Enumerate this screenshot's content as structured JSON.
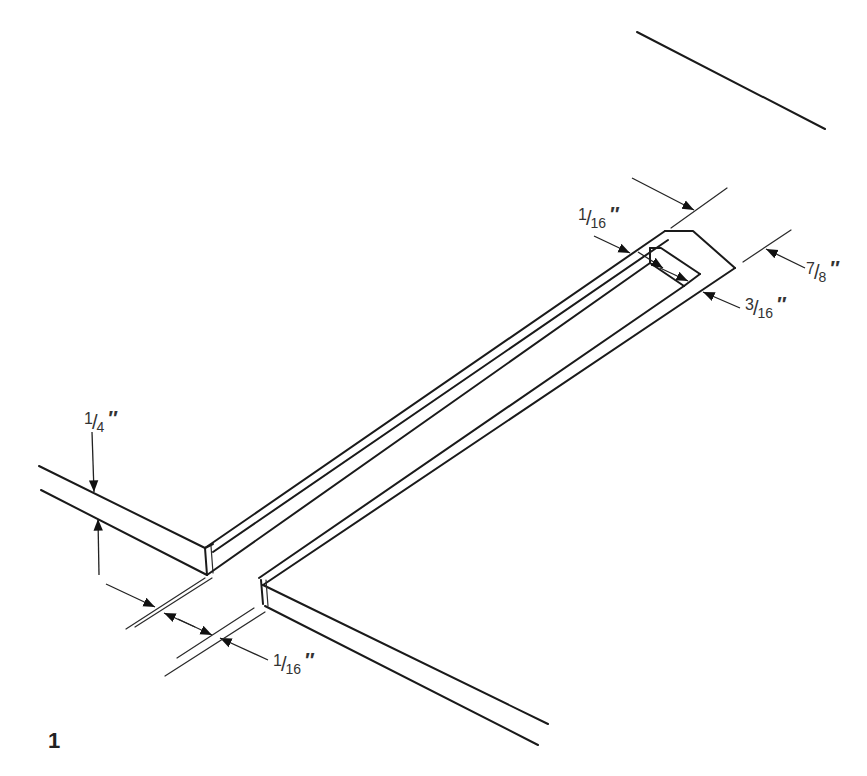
{
  "figure": {
    "number": "1",
    "type": "isometric construction diagram"
  },
  "dimensions": [
    {
      "id": "strip-thickness",
      "num": "1",
      "den": "4",
      "unit": "″",
      "label": "1/4″"
    },
    {
      "id": "gap-bottom",
      "num": "1",
      "den": "16",
      "unit": "″",
      "label": "1/16″"
    },
    {
      "id": "groove-lip",
      "num": "1",
      "den": "16",
      "unit": "″",
      "label": "1/16″"
    },
    {
      "id": "strip-width",
      "num": "7",
      "den": "8",
      "unit": "″",
      "label": "7/8″"
    },
    {
      "id": "groove-inner",
      "num": "3",
      "den": "16",
      "unit": "″",
      "label": "3/16″"
    }
  ],
  "colors": {
    "line": "#1a1a1a",
    "text": "#333333",
    "background": "#ffffff"
  }
}
